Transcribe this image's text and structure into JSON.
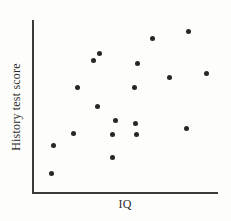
{
  "chart_data": {
    "type": "scatter",
    "title": "",
    "xlabel": "IQ",
    "ylabel": "History test score",
    "grid": false,
    "legend": false,
    "axis_ticks": false,
    "axis_tick_labels": false,
    "point_color": "#262626",
    "axis_color": "#3a3a3a",
    "background_color": "#fdfdfb",
    "xlim": [
      0,
      100
    ],
    "ylim": [
      0,
      100
    ],
    "n_points": 19,
    "relationship": "positive correlation",
    "points": [
      {
        "x": 10.8,
        "y": 11.5
      },
      {
        "x": 11.8,
        "y": 27.6
      },
      {
        "x": 22.6,
        "y": 34.5
      },
      {
        "x": 24.7,
        "y": 60.9
      },
      {
        "x": 33.3,
        "y": 76.4
      },
      {
        "x": 35.5,
        "y": 50.0
      },
      {
        "x": 36.6,
        "y": 80.5
      },
      {
        "x": 43.5,
        "y": 20.1
      },
      {
        "x": 43.5,
        "y": 33.3
      },
      {
        "x": 45.2,
        "y": 41.4
      },
      {
        "x": 55.4,
        "y": 60.3
      },
      {
        "x": 55.9,
        "y": 39.7
      },
      {
        "x": 56.5,
        "y": 33.3
      },
      {
        "x": 57.0,
        "y": 74.1
      },
      {
        "x": 65.1,
        "y": 88.5
      },
      {
        "x": 74.2,
        "y": 66.1
      },
      {
        "x": 83.3,
        "y": 36.2
      },
      {
        "x": 83.9,
        "y": 93.1
      },
      {
        "x": 93.5,
        "y": 68.4
      }
    ],
    "pixel_points": [
      {
        "px": 51,
        "py": 173
      },
      {
        "px": 53,
        "py": 145
      },
      {
        "px": 73,
        "py": 133
      },
      {
        "px": 77,
        "py": 87
      },
      {
        "px": 93,
        "py": 60
      },
      {
        "px": 97,
        "py": 106
      },
      {
        "px": 99,
        "py": 53
      },
      {
        "px": 112,
        "py": 157
      },
      {
        "px": 112,
        "py": 134
      },
      {
        "px": 115,
        "py": 120
      },
      {
        "px": 134,
        "py": 87
      },
      {
        "px": 135,
        "py": 123
      },
      {
        "px": 136,
        "py": 134
      },
      {
        "px": 137,
        "py": 63
      },
      {
        "px": 152,
        "py": 38
      },
      {
        "px": 169,
        "py": 77
      },
      {
        "px": 186,
        "py": 128
      },
      {
        "px": 188,
        "py": 31
      },
      {
        "px": 206,
        "py": 73
      }
    ]
  }
}
